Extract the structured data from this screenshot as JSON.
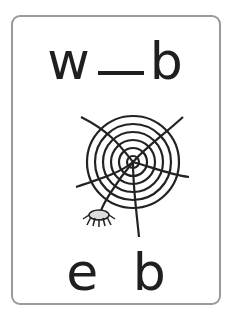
{
  "card": {
    "top_word": {
      "first": "w",
      "blank": "_",
      "last": "b"
    },
    "bottom_letters": {
      "first": "e",
      "second": "b"
    },
    "picture": "spider-web-icon",
    "colors": {
      "border": "#9a9a9a",
      "text": "#1f1f1f"
    }
  }
}
